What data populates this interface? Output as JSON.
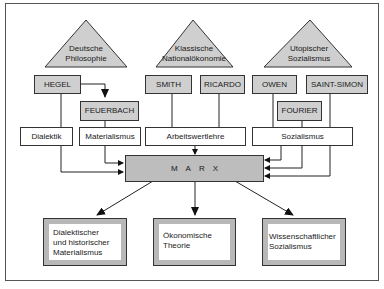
{
  "sources": [
    {
      "id": "deutsche-philosophie",
      "lines": [
        "Deutsche",
        "Philosophie"
      ]
    },
    {
      "id": "klassische-nationaloekonomie",
      "lines": [
        "Klassische",
        "Nationalökonomie"
      ]
    },
    {
      "id": "utopischer-sozialismus",
      "lines": [
        "Utopischer",
        "Sozialismus"
      ]
    }
  ],
  "thinkers": {
    "hegel": "HEGEL",
    "feuerbach": "FEUERBACH",
    "smith": "SMITH",
    "ricardo": "RICARDO",
    "owen": "OWEN",
    "saint_simon": "SAINT-SIMON",
    "fourier": "FOURIER"
  },
  "concepts": {
    "dialektik": "Dialektik",
    "materialismus": "Materialismus",
    "arbeitswertlehre": "Arbeitswertlehre",
    "sozialismus": "Sozialismus"
  },
  "center": {
    "label": "MARX"
  },
  "outcomes": [
    {
      "lines": [
        "Dialektischer",
        "und historischer",
        "Materialismus"
      ]
    },
    {
      "lines": [
        "Ökonomische",
        "Theorie"
      ]
    },
    {
      "lines": [
        "Wissenschaftlicher",
        "Sozialismus"
      ]
    }
  ],
  "colors": {
    "triangle_fill": "#cfcfcf",
    "thinker_fill": "#cfcfcf",
    "marx_fill": "#bdbdbd",
    "outcome_border_fill": "#b8b8b8",
    "line": "#222222"
  }
}
